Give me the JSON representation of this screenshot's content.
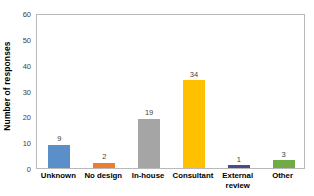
{
  "chart_data": {
    "type": "bar",
    "title": "",
    "xlabel": "",
    "ylabel": "Number of responses",
    "categories": [
      "Unknown",
      "No design",
      "In-house",
      "Consultant",
      "External\nreview",
      "Other"
    ],
    "values": [
      9,
      2,
      19,
      34,
      1,
      3
    ],
    "bar_colors": [
      "#5B8FC9",
      "#ED7D31",
      "#A5A5A5",
      "#FFC000",
      "#4A4A8C",
      "#6FAC46"
    ],
    "data_labels": [
      "9",
      "2",
      "19",
      "34",
      "1",
      "3"
    ],
    "ylim": [
      0,
      60
    ],
    "ytick_labels": [
      "0",
      "10",
      "20",
      "30",
      "40",
      "50",
      "60"
    ],
    "ytick_values": [
      0,
      10,
      20,
      30,
      40,
      50,
      60
    ],
    "grid": false,
    "legend": false,
    "plot_border_color": "#B9B9B9",
    "background_color": "#FFFFFF",
    "tick_label_color": "#3F3F3F",
    "axis_title_color": "#000000"
  }
}
